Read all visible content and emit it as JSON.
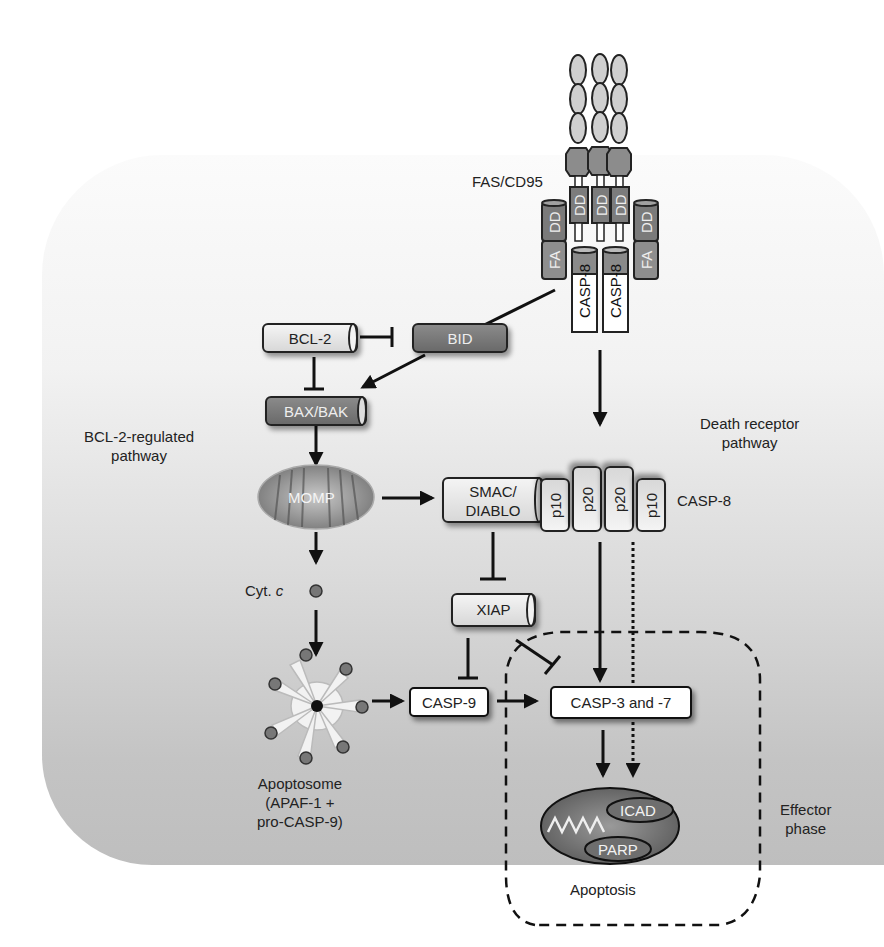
{
  "receptor": {
    "label": "FAS/CD95",
    "domains": [
      "DD",
      "DD",
      "DD"
    ],
    "adaptors": [
      {
        "top": "DD",
        "bottom": "FA"
      },
      {
        "top": "DD",
        "bottom": "FA"
      }
    ],
    "initiators": [
      "CASP-8",
      "CASP-8"
    ]
  },
  "nodes": {
    "bcl2": "BCL-2",
    "bid": "BID",
    "baxbak": "BAX/BAK",
    "momp": "MOMP",
    "smac_line1": "SMAC/",
    "smac_line2": "DIABLO",
    "xiap": "XIAP",
    "casp9": "CASP-9",
    "casp37": "CASP-3 and -7",
    "cytc_prefix": "Cyt.",
    "cytc_italic": "c",
    "icad": "ICAD",
    "parp": "PARP"
  },
  "casp8_subunits": [
    "p10",
    "p20",
    "p20",
    "p10"
  ],
  "labels": {
    "casp8_active": "CASP-8",
    "bcl2_pathway_line1": "BCL-2-regulated",
    "bcl2_pathway_line2": "pathway",
    "death_receptor_line1": "Death receptor",
    "death_receptor_line2": "pathway",
    "apoptosome_line1": "Apoptosome",
    "apoptosome_line2": "(APAF-1 +",
    "apoptosome_line3": "pro-CASP-9)",
    "effector_line1": "Effector",
    "effector_line2": "phase",
    "apoptosis": "Apoptosis"
  },
  "colors": {
    "dark_protein": "#757575",
    "light_protein": "#e6e6e6",
    "receptor_ellipse": "#cfcfcf",
    "receptor_hex": "#8c8c8c",
    "arrow": "#111111"
  }
}
